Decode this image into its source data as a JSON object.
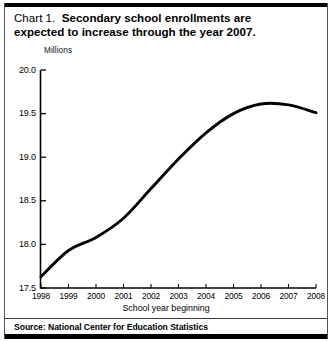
{
  "figure": {
    "title_prefix": "Chart 1.",
    "title_line1": "Secondary school enrollments are",
    "title_line2": "expected to increase through the year 2007.",
    "source": "Source: National Center for Education Statistics"
  },
  "chart_data": {
    "type": "line",
    "xlabel": "School year beginning",
    "ylabel": "Millions",
    "units_label": "Millions",
    "x": [
      1998,
      1999,
      2000,
      2001,
      2002,
      2003,
      2004,
      2005,
      2006,
      2007,
      2008
    ],
    "values": [
      17.63,
      17.93,
      18.08,
      18.3,
      18.64,
      18.98,
      19.28,
      19.5,
      19.61,
      19.6,
      19.51
    ],
    "categories": [
      "1998",
      "1999",
      "2000",
      "2001",
      "2002",
      "2003",
      "2004",
      "2005",
      "2006",
      "2007",
      "2008"
    ],
    "xtick_labels": [
      "1998",
      "1999",
      "2000",
      "2001",
      "2002",
      "2003",
      "2004",
      "2005",
      "2006",
      "2007",
      "2008"
    ],
    "ytick_labels": [
      "20.0",
      "19.5",
      "19.0",
      "18.5",
      "18.0",
      "17.5"
    ],
    "ytick_values": [
      20.0,
      19.5,
      19.0,
      18.5,
      18.0,
      17.5
    ],
    "ylim": [
      17.5,
      20.0
    ],
    "xlim": [
      1998,
      2008
    ],
    "grid": false,
    "legend": false,
    "line_color": "#000000",
    "peak_year": 2006,
    "peak_value": 19.61
  }
}
